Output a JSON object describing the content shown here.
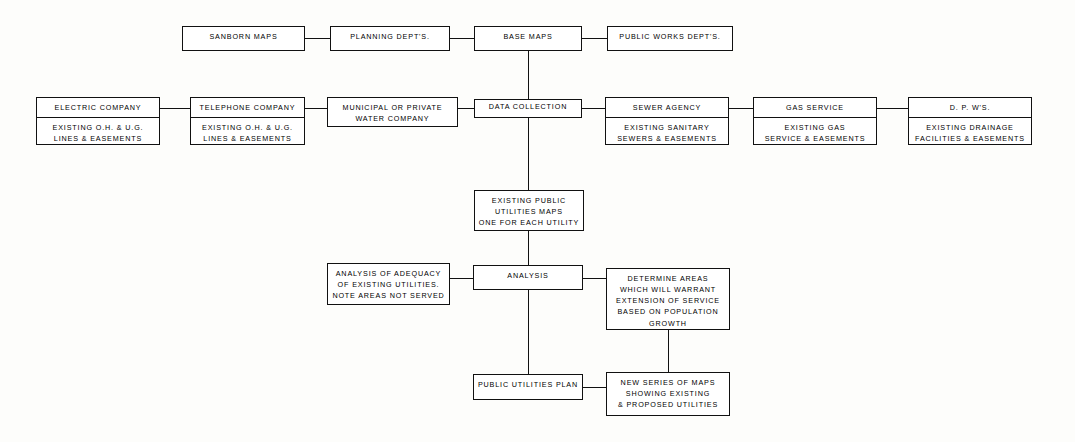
{
  "diagram": {
    "line_color": "#111111",
    "box_fill": "#ffffff",
    "background": "#fdfdfb",
    "nodes": {
      "sanborn_maps": {
        "head": "SANBORN MAPS"
      },
      "planning_depts": {
        "head": "PLANNING  DEPT'S."
      },
      "base_maps": {
        "head": "BASE MAPS"
      },
      "public_works_depts": {
        "head": "PUBLIC WORKS DEPT'S."
      },
      "electric_company": {
        "head": "ELECTRIC  COMPANY",
        "body": "EXISTING O.H. & U.G.\nLINES & EASEMENTS"
      },
      "telephone_company": {
        "head": "TELEPHONE  COMPANY",
        "body": "EXISTING O.H. & U.G.\nLINES & EASEMENTS"
      },
      "water_company": {
        "head": "MUNICIPAL   OR  PRIVATE\nWATER COMPANY"
      },
      "data_collection": {
        "head": "DATA COLLECTION"
      },
      "sewer_agency": {
        "head": "SEWER AGENCY",
        "body": "EXISTING  SANITARY\nSEWERS & EASEMENTS"
      },
      "gas_service": {
        "head": "GAS SERVICE",
        "body": "EXISTING GAS\nSERVICE & EASEMENTS"
      },
      "dpws": {
        "head": "D. P. W'S.",
        "body": "EXISTING  DRAINAGE\nFACILITIES & EASEMENTS"
      },
      "existing_public_utilities_maps": {
        "head": "EXISTING PUBLIC\nUTILITIES  MAPS\nONE FOR EACH UTILITY"
      },
      "analysis_of_adequacy": {
        "head": "ANALYSIS OF  ADEQUACY\nOF  EXISTING UTILITIES.\nNOTE  AREAS NOT SERVED"
      },
      "analysis": {
        "head": "ANALYSIS"
      },
      "determine_areas": {
        "head": "DETERMINE  AREAS\nWHICH WILL  WARRANT\nEXTENSION  OF SERVICE\nBASED  ON POPULATION\nGROWTH"
      },
      "public_utilities_plan": {
        "head": "PUBLIC  UTILITIES PLAN"
      },
      "new_series_of_maps": {
        "head": "NEW  SERIES   OF  MAPS\nSHOWING   EXISTING\n& PROPOSED  UTILITIES"
      }
    }
  }
}
